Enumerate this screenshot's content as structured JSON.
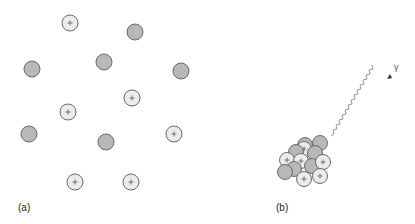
{
  "panel_a": {
    "label": "(a)",
    "particles": [
      {
        "type": "proton",
        "x": 70,
        "y": 23
      },
      {
        "type": "neutron",
        "x": 135,
        "y": 32
      },
      {
        "type": "neutron",
        "x": 32,
        "y": 69
      },
      {
        "type": "neutron",
        "x": 104,
        "y": 62
      },
      {
        "type": "neutron",
        "x": 181,
        "y": 71
      },
      {
        "type": "proton",
        "x": 132,
        "y": 98
      },
      {
        "type": "proton",
        "x": 68,
        "y": 112
      },
      {
        "type": "neutron",
        "x": 29,
        "y": 134
      },
      {
        "type": "neutron",
        "x": 106,
        "y": 142
      },
      {
        "type": "proton",
        "x": 174,
        "y": 134
      },
      {
        "type": "proton",
        "x": 75,
        "y": 182
      },
      {
        "type": "proton",
        "x": 131,
        "y": 182
      }
    ]
  },
  "panel_b": {
    "label": "(b)",
    "gamma_label": "γ",
    "nucleus": [
      {
        "type": "neutron",
        "x": 305,
        "y": 145
      },
      {
        "type": "neutron",
        "x": 320,
        "y": 143
      },
      {
        "type": "proton",
        "x": 304,
        "y": 149
      },
      {
        "type": "neutron",
        "x": 296,
        "y": 152
      },
      {
        "type": "neutron",
        "x": 315,
        "y": 153
      },
      {
        "type": "proton",
        "x": 287,
        "y": 160
      },
      {
        "type": "proton",
        "x": 301,
        "y": 161
      },
      {
        "type": "neutron",
        "x": 294,
        "y": 169
      },
      {
        "type": "neutron",
        "x": 312,
        "y": 166
      },
      {
        "type": "proton",
        "x": 323,
        "y": 162
      },
      {
        "type": "neutron",
        "x": 285,
        "y": 172
      },
      {
        "type": "proton",
        "x": 320,
        "y": 176
      },
      {
        "type": "proton",
        "x": 304,
        "y": 179
      }
    ]
  },
  "colors": {
    "proton_fill": "#ececec",
    "neutron_fill": "#b8b8b8",
    "stroke": "#6a6a6a"
  }
}
